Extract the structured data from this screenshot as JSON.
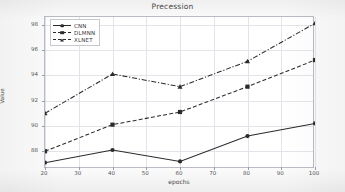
{
  "figure": {
    "title": "Precession",
    "xaxis_title": "epochs",
    "yaxis_title": "Value"
  },
  "legend": {
    "entries": [
      {
        "label": "CNN",
        "color": "#2b2b2b",
        "dash": "solid",
        "marker": "circle"
      },
      {
        "label": "DLMNN",
        "color": "#2b2b2b",
        "dash": "dashed",
        "marker": "square"
      },
      {
        "label": "XLNET",
        "color": "#2b2b2b",
        "dash": "dashdot",
        "marker": "triangle"
      }
    ]
  },
  "axes": {
    "x_ticks": [
      "20",
      "30",
      "40",
      "50",
      "60",
      "70",
      "80",
      "90",
      "100"
    ],
    "y_ticks": [
      "88",
      "90",
      "92",
      "94",
      "96",
      "98"
    ]
  },
  "chart_data": {
    "type": "line",
    "title": "Precession",
    "xlabel": "epochs",
    "ylabel": "Value",
    "x": [
      20,
      40,
      60,
      80,
      100
    ],
    "xlim": [
      20,
      100
    ],
    "ylim": [
      86.6,
      98.6
    ],
    "x_ticks": [
      20,
      30,
      40,
      50,
      60,
      70,
      80,
      90,
      100
    ],
    "y_ticks": [
      88,
      90,
      92,
      94,
      96,
      98
    ],
    "grid": true,
    "legend_position": "upper-left-inside",
    "series": [
      {
        "name": "CNN",
        "values": [
          87.1,
          88.1,
          87.2,
          89.2,
          90.2
        ],
        "color": "#2b2b2b",
        "linestyle": "solid",
        "marker": "circle"
      },
      {
        "name": "DLMNN",
        "values": [
          88.0,
          90.1,
          91.1,
          93.1,
          95.2
        ],
        "color": "#2b2b2b",
        "linestyle": "dashed",
        "marker": "square"
      },
      {
        "name": "XLNET",
        "values": [
          91.0,
          94.1,
          93.1,
          95.1,
          98.1
        ],
        "color": "#2b2b2b",
        "linestyle": "dashdot",
        "marker": "triangle"
      }
    ]
  }
}
